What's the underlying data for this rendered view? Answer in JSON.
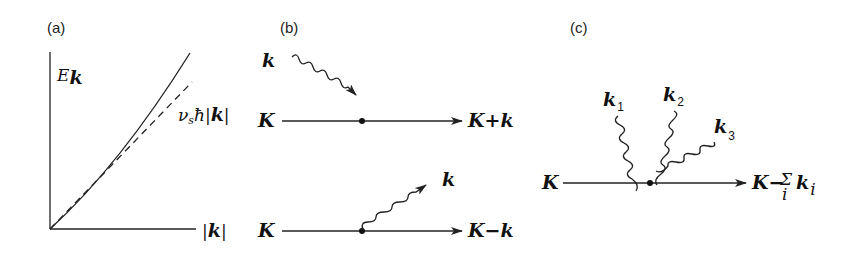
{
  "panels": {
    "a": {
      "label": "(a)",
      "y_axis_label": "E",
      "y_axis_sub": "k",
      "x_axis_label": "|k|",
      "curves": [
        {
          "name": "dispersion",
          "style": "solid"
        },
        {
          "name": "linear-asymptote",
          "style": "dashed",
          "label": "v",
          "label_sub": "s",
          "label_rest": "ħ|k|"
        }
      ]
    },
    "b": {
      "label": "(b)",
      "absorption": {
        "in_label": "K",
        "phonon_label": "k",
        "out_label": "K+k"
      },
      "emission": {
        "in_label": "K",
        "phonon_label": "k",
        "out_label": "K−k"
      }
    },
    "c": {
      "label": "(c)",
      "in_label": "K",
      "phonons": [
        {
          "label": "k",
          "sub": "1"
        },
        {
          "label": "k",
          "sub": "2"
        },
        {
          "label": "k",
          "sub": "3"
        }
      ],
      "out_label": "K−",
      "sum_symbol": "Σ",
      "sum_index": "i",
      "out_k": "k",
      "out_k_sub": "i"
    }
  }
}
